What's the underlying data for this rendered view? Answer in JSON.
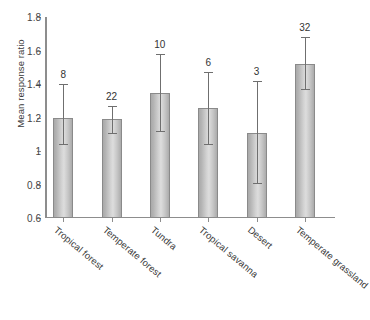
{
  "chart_data": {
    "type": "bar",
    "title": "",
    "subtitle": "",
    "xlabel": "",
    "ylabel": "Mean response ratio",
    "ylim": [
      0.6,
      1.8
    ],
    "yticks": [
      1.8,
      1.6,
      1.4,
      1.2,
      1,
      0.8,
      0.6
    ],
    "ytick_labels": [
      "1.8",
      "1.6",
      "1.4",
      "1.2",
      "1",
      "0.8",
      "0.6"
    ],
    "grid": false,
    "legend": null,
    "categories": [
      "Tropical forest",
      "Temperate forest",
      "Tundra",
      "Tropical savanna",
      "Desert",
      "Temperate grassland"
    ],
    "values": [
      1.2,
      1.19,
      1.345,
      1.255,
      1.105,
      1.52
    ],
    "error_upper": [
      1.4,
      1.27,
      1.58,
      1.47,
      1.42,
      1.68
    ],
    "error_lower": [
      1.04,
      1.11,
      1.12,
      1.04,
      0.81,
      1.37
    ],
    "annotations": [
      "8",
      "22",
      "10",
      "6",
      "3",
      "32"
    ],
    "annotation_meaning": "sample size n above each error bar",
    "bar_color": "#d2d2d2",
    "bar_edge_color": "#8a8a8a",
    "error_color": "#6f6f6f",
    "axis_color": "#8d8d8d"
  },
  "caption": {
    "text": ""
  }
}
